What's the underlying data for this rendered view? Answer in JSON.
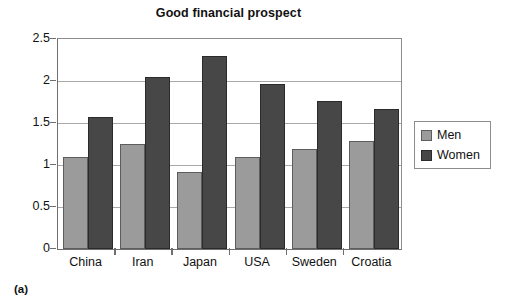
{
  "figure": {
    "caption": "(a)"
  },
  "legend": {
    "position": "right",
    "entries": [
      {
        "label": "Men",
        "color": "#9b9b9b"
      },
      {
        "label": "Women",
        "color": "#474747"
      }
    ]
  },
  "chart_data": {
    "type": "bar",
    "title": "Good financial prospect",
    "xlabel": "",
    "ylabel": "",
    "categories": [
      "China",
      "Iran",
      "Japan",
      "USA",
      "Sweden",
      "Croatia"
    ],
    "series": [
      {
        "name": "Men",
        "color": "#9b9b9b",
        "values": [
          1.1,
          1.25,
          0.92,
          1.09,
          1.19,
          1.28
        ]
      },
      {
        "name": "Women",
        "color": "#474747",
        "values": [
          1.57,
          2.05,
          2.3,
          1.97,
          1.76,
          1.67
        ]
      }
    ],
    "ylim": [
      0,
      2.5
    ],
    "yticks": [
      0,
      0.5,
      1,
      1.5,
      2,
      2.5
    ],
    "ytick_labels": [
      "0",
      "0.5",
      "1",
      "1.5",
      "2",
      "2.5"
    ],
    "grid": true,
    "grid_axis": "y",
    "legend_position": "right"
  }
}
